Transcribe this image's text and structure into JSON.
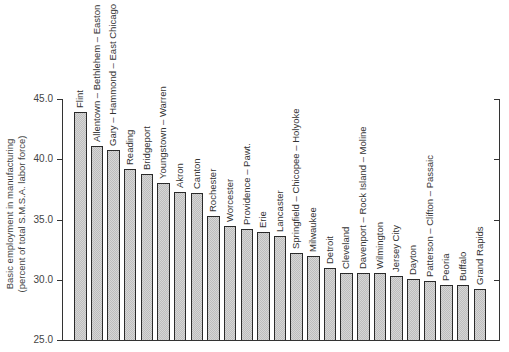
{
  "chart_data": {
    "type": "bar",
    "title": "",
    "xlabel": "",
    "ylabel": "Basic employment in manufacturing\n(percent of total S.M.S.A. labor force)",
    "ylabel_lines": [
      "Basic employment in manufacturing",
      "(percent of total S.M.S.A. labor force)"
    ],
    "ylim": [
      25.0,
      45.0
    ],
    "yticks": [
      25.0,
      30.0,
      35.0,
      40.0,
      45.0
    ],
    "ytick_labels": [
      "25.0",
      "30.0",
      "35.0",
      "40.0",
      "45.0"
    ],
    "grid": false,
    "legend": null,
    "categories": [
      "Flint",
      "Allentown – Bethlehem – Easton",
      "Gary – Hammond – East  Chicago",
      "Reading",
      "Bridgeport",
      "Youngstown – Warren",
      "Akron",
      "Canton",
      "Rochester",
      "Worcester",
      "Providence – Pawt.",
      "Erie",
      "Lancaster",
      "Springfield – Chicopee – Holyoke",
      "Milwaukee",
      "Detroit",
      "Cleveland",
      "Davenport – Rock  Island – Moline",
      "Wilmington",
      "Jersey  City",
      "Dayton",
      "Patterson – Clifton – Passaic",
      "Peoria",
      "Buffalo",
      "Grand  Rapids"
    ],
    "values": [
      43.9,
      41.1,
      40.8,
      39.2,
      38.8,
      38.0,
      37.3,
      37.2,
      35.3,
      34.5,
      34.2,
      34.0,
      33.6,
      32.2,
      32.0,
      31.0,
      30.6,
      30.6,
      30.6,
      30.3,
      30.1,
      29.9,
      29.6,
      29.6,
      29.2
    ]
  }
}
